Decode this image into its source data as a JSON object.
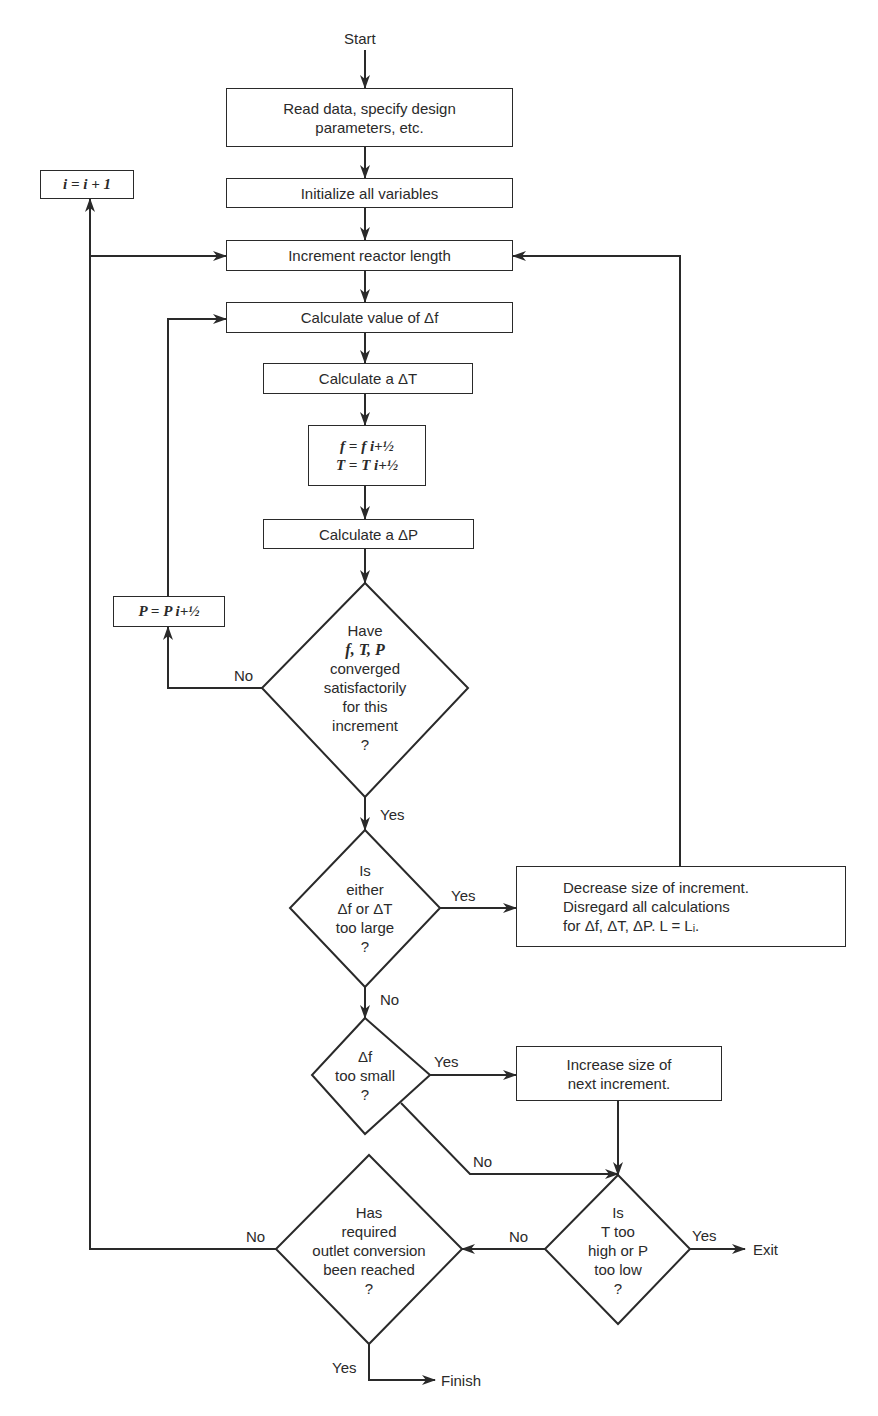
{
  "diagram": {
    "start_label": "Start",
    "nodes": {
      "read_data": {
        "lines": [
          "Read data, specify design",
          "parameters, etc."
        ]
      },
      "initialize": {
        "text": "Initialize all variables"
      },
      "increment_length": {
        "text": "Increment reactor length"
      },
      "calc_df": {
        "text": "Calculate value of Δf"
      },
      "calc_dt": {
        "text": "Calculate a ΔT"
      },
      "update_ft": {
        "lines": [
          "f = f i+½",
          "T = T i+½"
        ]
      },
      "calc_dp": {
        "text": "Calculate a ΔP"
      },
      "update_p": {
        "text": "P = P i+½"
      },
      "increment_i": {
        "text": "i = i + 1"
      },
      "converged": {
        "lines": [
          "Have",
          "f, T, P",
          "converged",
          "satisfactorily",
          "for this",
          "increment",
          "?"
        ]
      },
      "too_large": {
        "lines": [
          "Is",
          "either",
          "Δf or ΔT",
          "too large",
          "?"
        ]
      },
      "decrease": {
        "lines": [
          "Decrease size of increment.",
          "Disregard all calculations",
          "for Δf, ΔT, ΔP. L = Lᵢ."
        ]
      },
      "too_small": {
        "lines": [
          "Δf",
          "too small",
          "?"
        ]
      },
      "increase": {
        "lines": [
          "Increase size of",
          "next increment."
        ]
      },
      "t_high_p_low": {
        "lines": [
          "Is",
          "T too",
          "high or P",
          "too low",
          "?"
        ]
      },
      "outlet_reached": {
        "lines": [
          "Has",
          "required",
          "outlet conversion",
          "been reached",
          "?"
        ]
      }
    },
    "edge_labels": {
      "converged_no": "No",
      "converged_yes": "Yes",
      "too_large_yes": "Yes",
      "too_large_no": "No",
      "too_small_yes": "Yes",
      "too_small_no": "No",
      "t_p_yes": "Yes",
      "t_p_no": "No",
      "outlet_no": "No",
      "outlet_yes": "Yes"
    },
    "terminals": {
      "exit": "Exit",
      "finish": "Finish"
    }
  }
}
